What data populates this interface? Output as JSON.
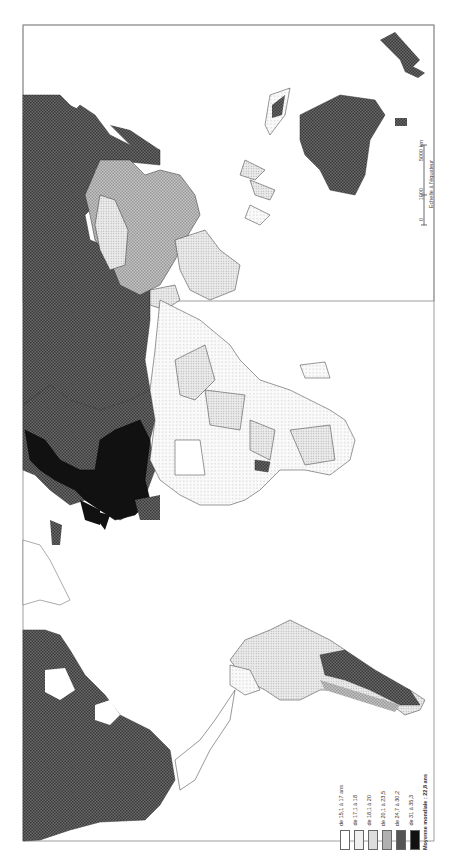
{
  "map": {
    "orientation": "rotated 90° (north to the left)",
    "subject": "Median age by country",
    "legend": {
      "classes": [
        {
          "label": "de 15,1 à 17 ans",
          "fill": "#ffffff",
          "pattern": "none"
        },
        {
          "label": "de 17,1 à 18",
          "fill": "#f2f2f2",
          "pattern": "sparse-dots"
        },
        {
          "label": "de 18,1 à 20",
          "fill": "#e2e2e2",
          "pattern": "dense-dots"
        },
        {
          "label": "de 20,1 à 23,5",
          "fill": "#b8b8b8",
          "pattern": "fine-checker"
        },
        {
          "label": "de 24,7 à 30,2",
          "fill": "#555555",
          "pattern": "dark-checker"
        },
        {
          "label": "de 31 à 35,3",
          "fill": "#111111",
          "pattern": "solid"
        }
      ],
      "note": "Moyenne mondiale : 22,8 ans"
    },
    "scale": {
      "ticks": [
        "0",
        "1000",
        "5000 km"
      ],
      "caption": "Echelle à l'équateur"
    }
  }
}
